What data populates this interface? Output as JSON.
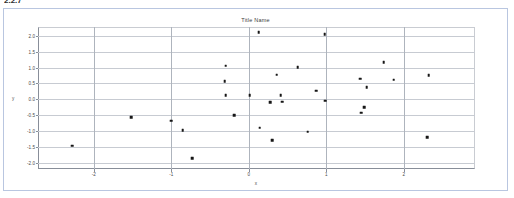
{
  "top_fragment": "2.2.7",
  "figure": {
    "title": "Title Name",
    "xlabel": "x",
    "ylabel": "y"
  },
  "chart_data": {
    "type": "scatter",
    "title": "Title Name",
    "xlabel": "x",
    "ylabel": "y",
    "xlim": [
      -2.72,
      2.92
    ],
    "ylim": [
      -2.2,
      2.28
    ],
    "xticks": [
      -2,
      -1,
      0,
      1,
      2
    ],
    "xtick_labels": [
      "-2",
      "-1",
      "0",
      "1",
      "2"
    ],
    "yticks": [
      -2.0,
      -1.5,
      -1.0,
      -0.5,
      0.0,
      0.5,
      1.0,
      1.5,
      2.0
    ],
    "ytick_labels": [
      "-2.0",
      "-1.5",
      "-1.0",
      "-0.5",
      "0.0",
      "0.5",
      "1.0",
      "1.5",
      "2.0"
    ],
    "grid": true,
    "legend": null,
    "marker": "square",
    "marker_color": "#161616",
    "points": [
      {
        "x": -2.28,
        "y": -1.46
      },
      {
        "x": -1.52,
        "y": -0.56
      },
      {
        "x": -1.0,
        "y": -0.68
      },
      {
        "x": -0.85,
        "y": -0.97
      },
      {
        "x": -0.73,
        "y": -1.85
      },
      {
        "x": -0.3,
        "y": 1.06
      },
      {
        "x": -0.31,
        "y": 0.57
      },
      {
        "x": -0.3,
        "y": 0.12
      },
      {
        "x": -0.19,
        "y": -0.5
      },
      {
        "x": 0.01,
        "y": 0.13
      },
      {
        "x": 0.13,
        "y": 2.12
      },
      {
        "x": 0.14,
        "y": -0.9
      },
      {
        "x": 0.28,
        "y": -0.09
      },
      {
        "x": 0.3,
        "y": -1.3
      },
      {
        "x": 0.36,
        "y": 0.78
      },
      {
        "x": 0.41,
        "y": 0.12
      },
      {
        "x": 0.43,
        "y": -0.08
      },
      {
        "x": 0.63,
        "y": 1.02
      },
      {
        "x": 0.76,
        "y": -1.02
      },
      {
        "x": 0.87,
        "y": 0.27
      },
      {
        "x": 0.98,
        "y": 2.06
      },
      {
        "x": 0.99,
        "y": -0.04
      },
      {
        "x": 1.44,
        "y": 0.65
      },
      {
        "x": 1.45,
        "y": -0.42
      },
      {
        "x": 1.49,
        "y": -0.25
      },
      {
        "x": 1.52,
        "y": 0.39
      },
      {
        "x": 1.74,
        "y": 1.17
      },
      {
        "x": 1.87,
        "y": 0.62
      },
      {
        "x": 2.32,
        "y": 0.76
      },
      {
        "x": 2.3,
        "y": -1.19
      }
    ]
  }
}
